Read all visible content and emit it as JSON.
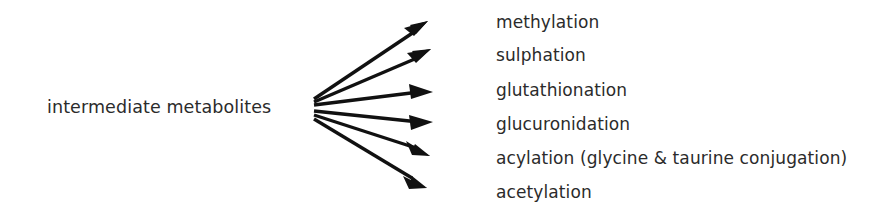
{
  "diagram": {
    "background_color": "#ffffff",
    "text_color": "#2b2b2b",
    "arrow_color": "#111111",
    "source": {
      "label": "intermediate metabolites",
      "x": 47,
      "y": 108
    },
    "fan_origin": {
      "x": 312,
      "y": 108
    },
    "arrow_count": 6,
    "products": [
      {
        "label": "methylation",
        "label_x": 496,
        "label_y": 22,
        "arrow_tip_x": 428,
        "arrow_tip_y": 21,
        "arrow_start_x": 314,
        "arrow_start_y": 99
      },
      {
        "label": "sulphation",
        "label_x": 496,
        "label_y": 55,
        "arrow_tip_x": 431,
        "arrow_tip_y": 49,
        "arrow_start_x": 314,
        "arrow_start_y": 102
      },
      {
        "label": "glutathionation",
        "label_x": 496,
        "label_y": 90,
        "arrow_tip_x": 433,
        "arrow_tip_y": 92,
        "arrow_start_x": 314,
        "arrow_start_y": 105
      },
      {
        "label": "glucuronidation",
        "label_x": 496,
        "label_y": 124,
        "arrow_tip_x": 433,
        "arrow_tip_y": 122,
        "arrow_start_x": 314,
        "arrow_start_y": 111
      },
      {
        "label": "acylation (glycine & taurine conjugation)",
        "label_x": 496,
        "label_y": 158,
        "arrow_tip_x": 430,
        "arrow_tip_y": 156,
        "arrow_start_x": 314,
        "arrow_start_y": 115
      },
      {
        "label": "acetylation",
        "label_x": 496,
        "label_y": 192,
        "arrow_tip_x": 427,
        "arrow_tip_y": 188,
        "arrow_start_x": 314,
        "arrow_start_y": 119
      }
    ]
  }
}
